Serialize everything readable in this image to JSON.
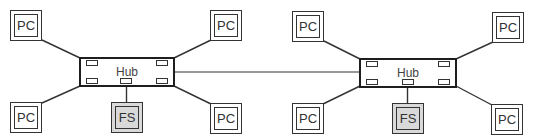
{
  "diagram": {
    "type": "network-topology",
    "colors": {
      "stroke": "#333333",
      "hub_border": "#1e1e1e",
      "fs_fill": "#d9d9d9",
      "background": "#ffffff"
    },
    "segments": [
      {
        "hub": {
          "label": "Hub"
        },
        "nodes": [
          {
            "id": "pc-top-left",
            "label": "PC",
            "kind": "pc"
          },
          {
            "id": "pc-top-right",
            "label": "PC",
            "kind": "pc"
          },
          {
            "id": "pc-bottom-left",
            "label": "PC",
            "kind": "pc"
          },
          {
            "id": "fs",
            "label": "FS",
            "kind": "file-server"
          },
          {
            "id": "pc-bottom-right",
            "label": "PC",
            "kind": "pc"
          }
        ]
      },
      {
        "hub": {
          "label": "Hub"
        },
        "nodes": [
          {
            "id": "pc-top-left",
            "label": "PC",
            "kind": "pc"
          },
          {
            "id": "pc-top-right",
            "label": "PC",
            "kind": "pc"
          },
          {
            "id": "pc-bottom-left",
            "label": "PC",
            "kind": "pc"
          },
          {
            "id": "fs",
            "label": "FS",
            "kind": "file-server"
          },
          {
            "id": "pc-bottom-right",
            "label": "PC",
            "kind": "pc"
          }
        ]
      }
    ],
    "links": [
      {
        "from": "segment-0-hub",
        "to": "segment-1-hub",
        "kind": "backbone"
      }
    ]
  }
}
